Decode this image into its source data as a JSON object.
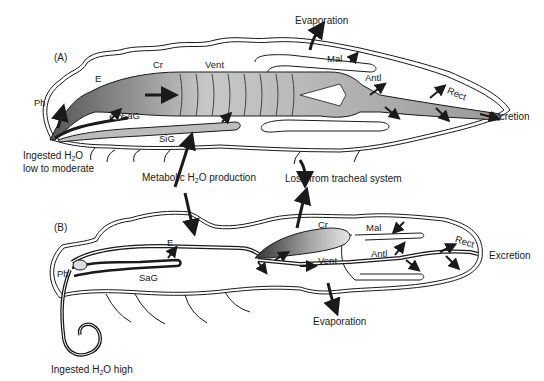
{
  "figure": {
    "panels": [
      {
        "id": "A",
        "label": "(A)",
        "condition": {
          "line1_pre": "Ingested H",
          "line1_sub": "2",
          "line1_post": "O",
          "line2": "low to moderate"
        },
        "organs": {
          "Ph": "Ph",
          "E": "E",
          "Cr": "Cr",
          "Vent": "Vent",
          "Mal": "Mal",
          "Antl": "Antl",
          "Rect": "Rect",
          "SaG": "SaG",
          "SiG": "SiG"
        },
        "fluxes": {
          "evaporation": "Evaporation",
          "excretion": "Excretion"
        }
      },
      {
        "id": "B",
        "label": "(B)",
        "condition": {
          "line1_pre": "Ingested H",
          "line1_sub": "2",
          "line1_post": "O high"
        },
        "organs": {
          "Ph": "Ph",
          "E": "E",
          "Cr": "Cr",
          "Vent": "Vent",
          "Mal": "Mal",
          "Antl": "Antl",
          "Rect": "Rect",
          "SaG": "SaG"
        },
        "fluxes": {
          "evaporation": "Evaporation",
          "excretion": "Excretion"
        }
      }
    ],
    "shared": {
      "metabolic_pre": "Metabolic H",
      "metabolic_sub": "2",
      "metabolic_post": "O production",
      "tracheal_loss": "Loss from tracheal system"
    },
    "colors": {
      "ink": "#1a1a1a",
      "shade": "#8a8a8a",
      "paper": "#ffffff"
    }
  }
}
